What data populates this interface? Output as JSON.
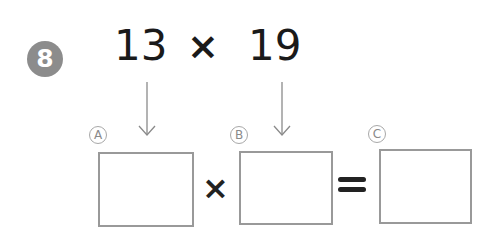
{
  "problem": {
    "number": "8",
    "multiplicand": "13",
    "operator": "×",
    "multiplier": "19"
  },
  "equation": {
    "boxes": [
      {
        "label": "A",
        "value": ""
      },
      {
        "label": "B",
        "value": ""
      },
      {
        "label": "C",
        "value": ""
      }
    ],
    "times_symbol": "×",
    "equals_symbol": "="
  },
  "colors": {
    "badge": "#8c8c8c",
    "box_border": "#999999",
    "arrow": "#888888",
    "text": "#1a1a1a"
  },
  "icons": {
    "arrow_a": "arrow-down-icon",
    "arrow_b": "arrow-down-icon"
  }
}
